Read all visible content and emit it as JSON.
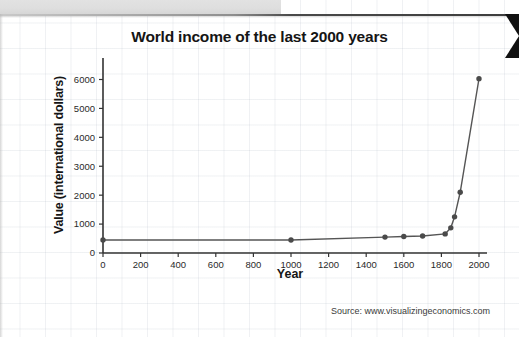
{
  "slide": {
    "background_color": "#ffffff",
    "top_band_color": "#dedede",
    "rule_color": "#3d3d3d",
    "pointer_color": "#111111",
    "grid_visible": true
  },
  "chart_data": {
    "type": "line",
    "title": "World income of the last 2000 years",
    "xlabel": "Year",
    "ylabel": "Value (international dollars)",
    "xlim": [
      0,
      2060
    ],
    "ylim": [
      0,
      6500
    ],
    "xticks": [
      0,
      200,
      400,
      600,
      800,
      1000,
      1200,
      1400,
      1600,
      1800,
      2000
    ],
    "xticklabels": [
      "0",
      "200",
      "400",
      "600",
      "800",
      "1000",
      "1200",
      "1400",
      "1600",
      "1800",
      "2000"
    ],
    "yticks": [
      0,
      1000,
      2000,
      3000,
      4000,
      5000,
      6000
    ],
    "yticklabels": [
      "0",
      "1000",
      "2000",
      "3000",
      "4000",
      "5000",
      "6000"
    ],
    "grid": false,
    "legend": false,
    "marker": "circle",
    "marker_color": "#4a4a4a",
    "line_color": "#555555",
    "series": [
      {
        "name": "World income",
        "x": [
          0,
          1000,
          1500,
          1600,
          1700,
          1820,
          1850,
          1870,
          1900,
          2000
        ],
        "values": [
          450,
          450,
          550,
          570,
          590,
          660,
          870,
          1250,
          2100,
          6030
        ]
      }
    ]
  },
  "source": {
    "text": "Source: www.visualizingeconomics.com"
  }
}
